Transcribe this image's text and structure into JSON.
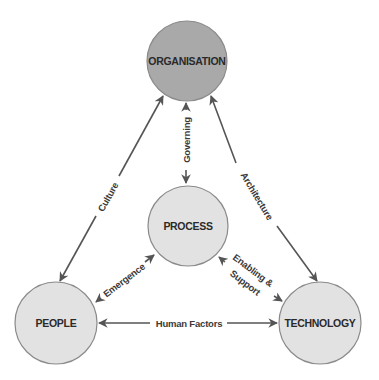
{
  "diagram": {
    "colors": {
      "organisation_fill": "#a9a9a9",
      "node_fill": "#e2e2e2",
      "node_stroke": "#8a8a8a",
      "edge": "#555555",
      "text": "#2a2a2a"
    },
    "nodes": {
      "organisation": {
        "label": "ORGANISATION"
      },
      "process": {
        "label": "PROCESS"
      },
      "people": {
        "label": "PEOPLE"
      },
      "technology": {
        "label": "TECHNOLOGY"
      }
    },
    "edges": {
      "culture": {
        "label": "Culture",
        "from": "ORGANISATION",
        "to": "PEOPLE",
        "direction": "bidirectional"
      },
      "architecture": {
        "label": "Architecture",
        "from": "ORGANISATION",
        "to": "TECHNOLOGY",
        "direction": "bidirectional"
      },
      "governing": {
        "label": "Governing",
        "from": "ORGANISATION",
        "to": "PROCESS",
        "direction": "bidirectional"
      },
      "emergence": {
        "label": "Emergence",
        "from": "PEOPLE",
        "to": "PROCESS",
        "direction": "bidirectional"
      },
      "enabling_support": {
        "label_line1": "Enabling &",
        "label_line2": "Support",
        "from": "PROCESS",
        "to": "TECHNOLOGY",
        "direction": "bidirectional"
      },
      "human_factors": {
        "label": "Human Factors",
        "from": "PEOPLE",
        "to": "TECHNOLOGY",
        "direction": "bidirectional"
      }
    }
  }
}
